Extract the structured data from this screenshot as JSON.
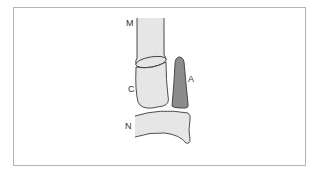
{
  "diagram": {
    "labels": {
      "m": "M",
      "c": "C",
      "a": "A",
      "n": "N"
    },
    "colors": {
      "bone_fill": "#e6e6e6",
      "accessory_fill": "#8c8c8c",
      "outline": "#3a3a3a",
      "frame": "#b4b4b4",
      "background": "#ffffff"
    }
  }
}
